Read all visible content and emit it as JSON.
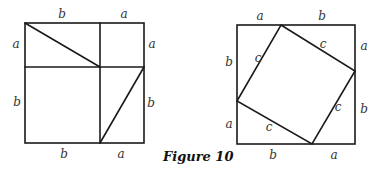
{
  "caption": "Figure 10",
  "left_square": {
    "labels": {
      "top_left": "b",
      "top_right": "a",
      "left_top": "a",
      "left_bottom": "b",
      "right_top": "a",
      "right_bottom": "b",
      "bottom_left": "b",
      "bottom_right": "a"
    }
  },
  "right_square": {
    "labels": {
      "top_left": "a",
      "top_right": "b",
      "right_top": "a",
      "right_bottom": "b",
      "bottom_left": "b",
      "bottom_right": "a",
      "left_top": "b",
      "left_bottom": "a",
      "inner_top_left": "c",
      "inner_top_right": "c",
      "inner_bottom_right": "c",
      "inner_bottom_left": "c"
    }
  }
}
